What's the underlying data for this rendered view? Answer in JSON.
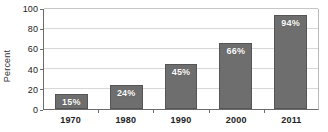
{
  "chart_data": {
    "type": "bar",
    "title": "",
    "subtitle": "",
    "xlabel": "",
    "ylabel": "Percent",
    "categories": [
      "1970",
      "1980",
      "1990",
      "2000",
      "2011"
    ],
    "values": [
      15,
      24,
      45,
      66,
      94
    ],
    "data_labels": [
      "15%",
      "24%",
      "45%",
      "66%",
      "94%"
    ],
    "ylim": [
      0,
      100
    ],
    "y_ticks": [
      0,
      20,
      40,
      60,
      80,
      100
    ],
    "y_tick_labels": [
      "0",
      "20",
      "40",
      "60",
      "80",
      "100"
    ],
    "grid": true,
    "grid_axis": "y",
    "legend": false,
    "legend_position": "none",
    "series": [
      {
        "name": "Percent",
        "values": [
          15,
          24,
          45,
          66,
          94
        ]
      }
    ],
    "colors": {
      "bar_fill": "#6e6e6e",
      "bar_border": "#555555",
      "data_label": "#ffffff",
      "gridline": "#d8d8d8",
      "axis": "#6b6b6b",
      "tick_text": "#222222",
      "axis_title": "#333333",
      "background": "#ffffff"
    }
  }
}
